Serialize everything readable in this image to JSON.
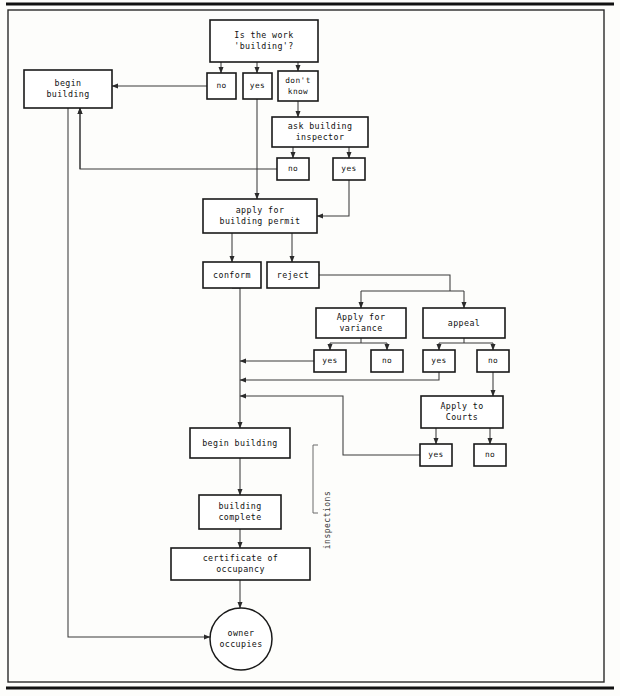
{
  "figure": {
    "kind": "flowchart",
    "background_color": "#fdfdfb",
    "line_color": "#5a5a5a",
    "box_stroke_color": "#1a1a1a",
    "text_color": "#111111"
  },
  "frame": {
    "top_rule": {
      "x1": 6,
      "y1": 4,
      "x2": 614,
      "y2": 4,
      "width": 3
    },
    "bottom_rule": {
      "x1": 6,
      "y1": 688,
      "x2": 614,
      "y2": 688,
      "width": 3
    },
    "border": {
      "x": 8,
      "y": 10,
      "width": 596,
      "height": 672
    }
  },
  "nodes": [
    {
      "id": "is-the-work-building",
      "x": 210,
      "y": 20,
      "w": 108,
      "h": 42,
      "lines": [
        "Is the work",
        "'building'?"
      ],
      "shape": "rect",
      "weight": "bold"
    },
    {
      "id": "begin-building-top",
      "x": 24,
      "y": 70,
      "w": 88,
      "h": 38,
      "lines": [
        "begin",
        "building"
      ],
      "shape": "rect",
      "weight": "bold"
    },
    {
      "id": "no-1",
      "x": 207,
      "y": 73,
      "w": 29,
      "h": 26,
      "lines": [
        "no"
      ],
      "shape": "rect",
      "weight": "bold"
    },
    {
      "id": "yes-1",
      "x": 243,
      "y": 73,
      "w": 29,
      "h": 26,
      "lines": [
        "yes"
      ],
      "shape": "rect",
      "weight": "bold"
    },
    {
      "id": "dont-know",
      "x": 278,
      "y": 71,
      "w": 40,
      "h": 30,
      "lines": [
        "don't",
        "know"
      ],
      "shape": "rect",
      "weight": "bold"
    },
    {
      "id": "ask-building-inspector",
      "x": 272,
      "y": 117,
      "w": 96,
      "h": 30,
      "lines": [
        "ask building",
        "inspector"
      ],
      "shape": "rect",
      "weight": "bold"
    },
    {
      "id": "no-2",
      "x": 277,
      "y": 158,
      "w": 32,
      "h": 22,
      "lines": [
        "no"
      ],
      "shape": "rect",
      "weight": "bold"
    },
    {
      "id": "yes-2",
      "x": 333,
      "y": 158,
      "w": 32,
      "h": 22,
      "lines": [
        "yes"
      ],
      "shape": "rect",
      "weight": "bold"
    },
    {
      "id": "apply-for-building-permit",
      "x": 203,
      "y": 199,
      "w": 114,
      "h": 34,
      "lines": [
        "apply for",
        "building permit"
      ],
      "shape": "rect",
      "weight": "bold"
    },
    {
      "id": "conform",
      "x": 203,
      "y": 262,
      "w": 58,
      "h": 26,
      "lines": [
        "conform"
      ],
      "shape": "rect",
      "weight": "bold"
    },
    {
      "id": "reject",
      "x": 267,
      "y": 262,
      "w": 52,
      "h": 26,
      "lines": [
        "reject"
      ],
      "shape": "rect",
      "weight": "bold"
    },
    {
      "id": "apply-for-variance",
      "x": 316,
      "y": 308,
      "w": 90,
      "h": 30,
      "lines": [
        "Apply for",
        "variance"
      ],
      "shape": "rect",
      "weight": "bold"
    },
    {
      "id": "appeal",
      "x": 423,
      "y": 308,
      "w": 82,
      "h": 30,
      "lines": [
        "appeal"
      ],
      "shape": "rect",
      "weight": "bold"
    },
    {
      "id": "variance-yes",
      "x": 314,
      "y": 350,
      "w": 32,
      "h": 22,
      "lines": [
        "yes"
      ],
      "shape": "rect",
      "weight": "bold"
    },
    {
      "id": "variance-no",
      "x": 371,
      "y": 350,
      "w": 32,
      "h": 22,
      "lines": [
        "no"
      ],
      "shape": "rect",
      "weight": "bold"
    },
    {
      "id": "appeal-yes",
      "x": 423,
      "y": 350,
      "w": 32,
      "h": 22,
      "lines": [
        "yes"
      ],
      "shape": "rect",
      "weight": "bold"
    },
    {
      "id": "appeal-no",
      "x": 477,
      "y": 350,
      "w": 32,
      "h": 22,
      "lines": [
        "no"
      ],
      "shape": "rect",
      "weight": "bold"
    },
    {
      "id": "apply-to-courts",
      "x": 421,
      "y": 396,
      "w": 82,
      "h": 32,
      "lines": [
        "Apply to",
        "Courts"
      ],
      "shape": "rect",
      "weight": "bold"
    },
    {
      "id": "courts-yes",
      "x": 420,
      "y": 444,
      "w": 32,
      "h": 22,
      "lines": [
        "yes"
      ],
      "shape": "rect",
      "weight": "bold"
    },
    {
      "id": "courts-no",
      "x": 474,
      "y": 444,
      "w": 32,
      "h": 22,
      "lines": [
        "no"
      ],
      "shape": "rect",
      "weight": "bold"
    },
    {
      "id": "begin-building-main",
      "x": 190,
      "y": 428,
      "w": 100,
      "h": 30,
      "lines": [
        "begin building"
      ],
      "shape": "rect",
      "weight": "bold"
    },
    {
      "id": "building-complete",
      "x": 199,
      "y": 495,
      "w": 82,
      "h": 34,
      "lines": [
        "building",
        "complete"
      ],
      "shape": "rect",
      "weight": "bold"
    },
    {
      "id": "certificate-of-occupancy",
      "x": 171,
      "y": 548,
      "w": 139,
      "h": 32,
      "lines": [
        "certificate of",
        "occupancy"
      ],
      "shape": "rect",
      "weight": "bold"
    },
    {
      "id": "owner-occupies",
      "x": 210,
      "y": 608,
      "w": 62,
      "h": 62,
      "lines": [
        "owner",
        "occupies"
      ],
      "shape": "circle",
      "weight": "normal"
    }
  ],
  "annotations": [
    {
      "id": "inspections-label",
      "text": "inspections",
      "x": 330,
      "y": 520,
      "rotate": -90
    }
  ],
  "edges": [
    {
      "id": "work-to-no1",
      "d": "M 221 62 L 221 73",
      "arrow": "end"
    },
    {
      "id": "work-to-yes1",
      "d": "M 257 62 L 257 73",
      "arrow": "end"
    },
    {
      "id": "work-to-dontknow",
      "d": "M 298 62 L 298 71",
      "arrow": "end"
    },
    {
      "id": "no1-to-begin-building",
      "d": "M 207 86 L 112 86",
      "arrow": "end"
    },
    {
      "id": "yes1-to-apply-permit",
      "d": "M 257 99 L 257 199",
      "arrow": "end"
    },
    {
      "id": "dontknow-to-ask",
      "d": "M 298 101 L 298 117",
      "arrow": "end"
    },
    {
      "id": "ask-to-no2",
      "d": "M 293 147 L 293 158",
      "arrow": "end"
    },
    {
      "id": "ask-to-yes2",
      "d": "M 349 147 L 349 158",
      "arrow": "end"
    },
    {
      "id": "no2-to-begin-building",
      "d": "M 277 169 L 80 169 L 80 108",
      "arrow": "end"
    },
    {
      "id": "yes2-to-apply-permit",
      "d": "M 349 180 L 349 216 L 317 216",
      "arrow": "end"
    },
    {
      "id": "permit-to-conform",
      "d": "M 232 233 L 232 262",
      "arrow": "end"
    },
    {
      "id": "permit-to-reject",
      "d": "M 292 233 L 292 262",
      "arrow": "end"
    },
    {
      "id": "reject-split",
      "d": "M 319 275 L 450 275 L 450 291",
      "arrow": "none"
    },
    {
      "id": "split-bar",
      "d": "M 361 291 L 464 291",
      "arrow": "none"
    },
    {
      "id": "split-to-variance",
      "d": "M 361 291 L 361 308",
      "arrow": "end"
    },
    {
      "id": "split-to-appeal",
      "d": "M 464 291 L 464 308",
      "arrow": "end"
    },
    {
      "id": "variance-split-bar",
      "d": "M 330 343 L 387 343",
      "arrow": "none"
    },
    {
      "id": "variance-stem",
      "d": "M 361 338 L 361 343",
      "arrow": "none"
    },
    {
      "id": "variance-to-yes",
      "d": "M 330 343 L 330 350",
      "arrow": "end"
    },
    {
      "id": "variance-to-no",
      "d": "M 387 343 L 387 350",
      "arrow": "end"
    },
    {
      "id": "appeal-split-bar",
      "d": "M 439 343 L 493 343",
      "arrow": "none"
    },
    {
      "id": "appeal-stem",
      "d": "M 464 338 L 464 343",
      "arrow": "none"
    },
    {
      "id": "appeal-to-yes",
      "d": "M 439 343 L 439 350",
      "arrow": "end"
    },
    {
      "id": "appeal-to-no",
      "d": "M 493 343 L 493 350",
      "arrow": "end"
    },
    {
      "id": "variance-yes-merge",
      "d": "M 314 361 L 240 361",
      "arrow": "end"
    },
    {
      "id": "appeal-yes-merge",
      "d": "M 439 372 L 439 380 L 240 380",
      "arrow": "end"
    },
    {
      "id": "appeal-no-to-courts",
      "d": "M 493 372 L 493 396",
      "arrow": "end"
    },
    {
      "id": "courts-to-yes",
      "d": "M 436 428 L 436 444",
      "arrow": "end"
    },
    {
      "id": "courts-to-no",
      "d": "M 490 428 L 490 444",
      "arrow": "end"
    },
    {
      "id": "courts-yes-merge",
      "d": "M 420 455 L 343 455 L 343 396 L 240 396",
      "arrow": "end"
    },
    {
      "id": "conform-to-begin",
      "d": "M 232 288 L 240 288 L 240 428",
      "arrow": "end"
    },
    {
      "id": "begin-to-complete",
      "d": "M 240 458 L 240 495",
      "arrow": "end"
    },
    {
      "id": "complete-to-certificate",
      "d": "M 240 529 L 240 548",
      "arrow": "end"
    },
    {
      "id": "certificate-to-owner",
      "d": "M 240 580 L 240 608",
      "arrow": "end"
    },
    {
      "id": "begin-building-top-down",
      "d": "M 68 108 L 68 637 L 210 637",
      "arrow": "end"
    },
    {
      "id": "up-into-begin-building",
      "d": "M 80 169 L 80 108",
      "arrow": "end"
    }
  ],
  "brackets": [
    {
      "id": "inspections-bracket",
      "d": "M 318 445 L 313 445 L 313 513 L 318 513"
    }
  ]
}
